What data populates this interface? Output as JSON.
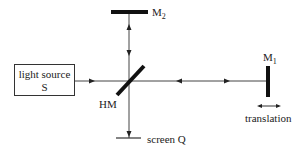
{
  "diagram": {
    "light_source": {
      "line1": "light source",
      "line2": "S"
    },
    "beam_splitter": {
      "label": "HM"
    },
    "mirror_2": {
      "label": "M",
      "subscript": "2"
    },
    "mirror_1": {
      "label": "M",
      "subscript": "1"
    },
    "screen": {
      "label": "screen Q"
    },
    "translation": {
      "label": "translation"
    },
    "colors": {
      "line": "#333333",
      "mirror": "#111111",
      "background": "#ffffff"
    }
  }
}
